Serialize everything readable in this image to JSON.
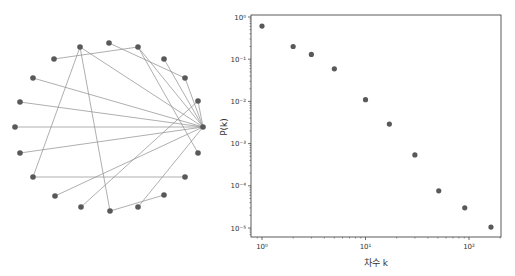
{
  "network": {
    "node_color": "#595959",
    "edge_color": "#8c8c8c",
    "nodes": [
      {
        "id": "A",
        "x": 80,
        "y": 47
      },
      {
        "id": "B",
        "x": 109,
        "y": 43
      },
      {
        "id": "C",
        "x": 138,
        "y": 47
      },
      {
        "id": "D",
        "x": 54,
        "y": 59
      },
      {
        "id": "E",
        "x": 164,
        "y": 59
      },
      {
        "id": "F",
        "x": 33,
        "y": 78
      },
      {
        "id": "G",
        "x": 185,
        "y": 78
      },
      {
        "id": "H",
        "x": 20,
        "y": 102
      },
      {
        "id": "I",
        "x": 198,
        "y": 101
      },
      {
        "id": "J",
        "x": 15,
        "y": 127
      },
      {
        "id": "K",
        "x": 203,
        "y": 127
      },
      {
        "id": "L",
        "x": 20,
        "y": 153
      },
      {
        "id": "M",
        "x": 198,
        "y": 153
      },
      {
        "id": "N",
        "x": 33,
        "y": 177
      },
      {
        "id": "O",
        "x": 185,
        "y": 177
      },
      {
        "id": "P",
        "x": 55,
        "y": 196
      },
      {
        "id": "Q",
        "x": 164,
        "y": 195
      },
      {
        "id": "R",
        "x": 81,
        "y": 207
      },
      {
        "id": "S",
        "x": 110,
        "y": 211
      },
      {
        "id": "T",
        "x": 138,
        "y": 207
      }
    ],
    "edges": [
      [
        "D",
        "C"
      ],
      [
        "A",
        "K"
      ],
      [
        "A",
        "N"
      ],
      [
        "A",
        "S"
      ],
      [
        "B",
        "G"
      ],
      [
        "C",
        "K"
      ],
      [
        "C",
        "M"
      ],
      [
        "E",
        "K"
      ],
      [
        "G",
        "K"
      ],
      [
        "F",
        "K"
      ],
      [
        "H",
        "K"
      ],
      [
        "J",
        "K"
      ],
      [
        "L",
        "K"
      ],
      [
        "N",
        "O"
      ],
      [
        "P",
        "K"
      ],
      [
        "R",
        "I"
      ],
      [
        "S",
        "Q"
      ],
      [
        "T",
        "K"
      ],
      [
        "I",
        "K"
      ]
    ]
  },
  "chart_data": {
    "type": "scatter",
    "title": "",
    "xlabel": "차수 k",
    "ylabel": "P(k)",
    "xscale": "log",
    "yscale": "log",
    "xlim": [
      0.8,
      200
    ],
    "ylim": [
      7e-06,
      1
    ],
    "x_ticks": [
      {
        "value": 1,
        "label": "10⁰"
      },
      {
        "value": 10,
        "label": "10¹"
      },
      {
        "value": 100,
        "label": "10²"
      }
    ],
    "y_ticks": [
      {
        "value": 1,
        "label": "10⁰"
      },
      {
        "value": 0.1,
        "label": "10⁻¹"
      },
      {
        "value": 0.01,
        "label": "10⁻²"
      },
      {
        "value": 0.001,
        "label": "10⁻³"
      },
      {
        "value": 0.0001,
        "label": "10⁻⁴"
      },
      {
        "value": 1e-05,
        "label": "10⁻⁵"
      }
    ],
    "grid": false,
    "marker_color": "#595959",
    "x": [
      1,
      2,
      3,
      5,
      10,
      17,
      30,
      51,
      91,
      163
    ],
    "y": [
      0.61,
      0.2,
      0.13,
      0.059,
      0.011,
      0.0029,
      0.00054,
      7.6e-05,
      3e-05,
      1.05e-05
    ]
  },
  "layout": {
    "plot_left": 251,
    "plot_right": 501,
    "plot_top": 15,
    "plot_bottom": 237,
    "x_px_per_decade": 103.5,
    "x_origin_px": 262,
    "y_px_per_decade": 42.2,
    "y_origin_px": 17
  }
}
